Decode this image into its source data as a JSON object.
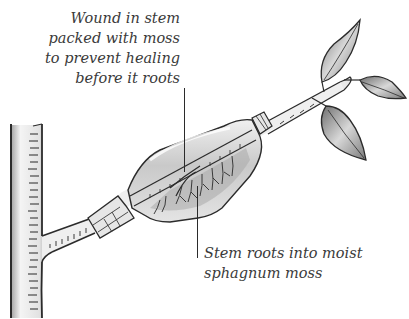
{
  "diagram": {
    "labels": [
      {
        "id": "wound",
        "lines": [
          "Wound in stem",
          "packed with moss",
          "to prevent healing",
          "before it roots"
        ],
        "points_to": "wound-in-stem"
      },
      {
        "id": "roots",
        "lines": [
          "Stem roots into moist",
          "sphagnum moss"
        ],
        "points_to": "roots-in-moss"
      }
    ],
    "parts": [
      "main-trunk",
      "side-branch",
      "plastic-wrap",
      "tie-left",
      "tie-right",
      "sphagnum-moss",
      "new-roots",
      "leaves"
    ],
    "colors": {
      "ink": "#2b2b2b",
      "label_text": "#3a3a3a",
      "wrap_shade": "#bdbdbd",
      "leaf_shade": "#8c8c8c",
      "background": "#ffffff"
    }
  }
}
